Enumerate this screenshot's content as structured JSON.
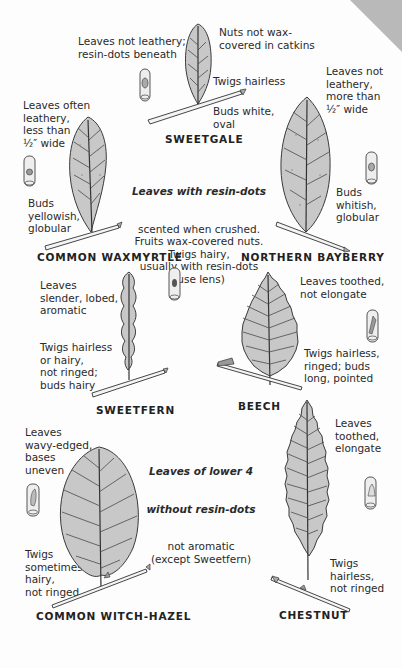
{
  "page": {
    "background": "#fdfdfd",
    "leaf_fill": "#c8c8c8",
    "curl_color": "#b9b9b9"
  },
  "sweetgale": {
    "name": "SWEETGALE",
    "note_leaves": "Leaves not leathery;\nresin-dots beneath",
    "note_nuts": "Nuts not wax-\ncovered in catkins",
    "note_twigs": "Twigs hairless",
    "note_buds": "Buds white,\noval"
  },
  "waxmyrtle": {
    "name": "COMMON WAXMYRTLE",
    "note_leaves": "Leaves often\nleathery,\nless than\n½″ wide",
    "note_buds": "Buds\nyellowish,\nglobular"
  },
  "bayberry": {
    "name": "NORTHERN BAYBERRY",
    "note_leaves": "Leaves not\nleathery,\nmore than\n½″ wide",
    "note_buds": "Buds\nwhitish,\nglobular"
  },
  "group_upper": {
    "heading": "Leaves with resin-dots",
    "body": "scented when crushed.\nFruits wax-covered nuts.\nTwigs hairy,\nusually with resin-dots\n(use lens)"
  },
  "sweetfern": {
    "name": "SWEETFERN",
    "note_leaves": "Leaves\nslender, lobed,\naromatic",
    "note_twigs": "Twigs hairless\nor hairy,\nnot ringed;\nbuds hairy"
  },
  "beech": {
    "name": "BEECH",
    "note_leaves": "Leaves toothed,\nnot elongate",
    "note_twigs": "Twigs hairless,\nringed; buds\nlong, pointed"
  },
  "group_lower": {
    "heading_line1": "Leaves of lower 4",
    "heading_line2": "without resin-dots",
    "body": "not aromatic\n(except Sweetfern)"
  },
  "witchhazel": {
    "name": "COMMON WITCH-HAZEL",
    "note_leaves": "Leaves\nwavy-edged,\nbases\nuneven",
    "note_twigs": "Twigs\nsometimes\nhairy,\nnot ringed"
  },
  "chestnut": {
    "name": "CHESTNUT",
    "note_leaves": "Leaves\ntoothed,\nelongate",
    "note_twigs": "Twigs\nhairless,\nnot ringed"
  }
}
